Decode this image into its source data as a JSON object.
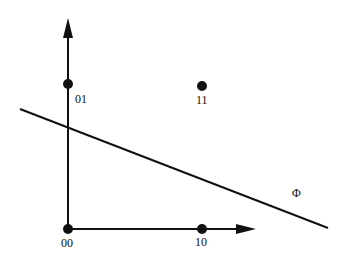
{
  "diagram": {
    "points": [
      {
        "label": "00",
        "x": 68,
        "y": 229
      },
      {
        "label": "01",
        "x": 68,
        "y": 84
      },
      {
        "label": "10",
        "x": 202,
        "y": 229
      },
      {
        "label": "11",
        "x": 202,
        "y": 86
      }
    ],
    "line_label": "Φ",
    "colors": {
      "ink": "#111111",
      "background": "#ffffff"
    }
  }
}
